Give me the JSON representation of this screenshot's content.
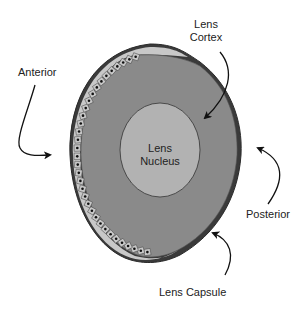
{
  "labels": {
    "cortex_line1": "Lens",
    "cortex_line2": "Cortex",
    "anterior": "Anterior",
    "nucleus_line1": "Lens",
    "nucleus_line2": "Nucleus",
    "posterior": "Posterior",
    "capsule": "Lens Capsule"
  },
  "colors": {
    "background": "#ffffff",
    "capsule_outline": "#333333",
    "cortex_fill": "#8a8a8a",
    "nucleus_fill": "#b2b2b2",
    "epithelium_fill": "#c8c8c8",
    "epithelium_nucleus": "#111111",
    "arrow": "#111111",
    "text": "#222222"
  },
  "structures": [
    {
      "name": "Lens Capsule",
      "type": "outer boundary"
    },
    {
      "name": "Lens Epithelium",
      "type": "cell layer along anterior surface"
    },
    {
      "name": "Lens Cortex",
      "type": "outer layer"
    },
    {
      "name": "Lens Nucleus",
      "type": "central ellipse"
    }
  ]
}
